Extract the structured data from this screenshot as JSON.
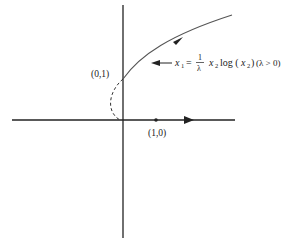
{
  "diagram": {
    "axes": {
      "origin": {
        "x": 123,
        "y": 120
      },
      "x_axis": {
        "x1": 12,
        "x2": 235,
        "y": 120
      },
      "y_axis": {
        "x": 123,
        "y1": 5,
        "y2": 238
      }
    },
    "points": {
      "p01": {
        "label": "(0,1)",
        "x": 123,
        "y": 79
      },
      "p10": {
        "label": "(1,0)",
        "x": 156,
        "y": 120
      }
    },
    "curve": {
      "equation_lhs": "x",
      "equation_lhs_sub": "1",
      "equation_eq": "=",
      "frac_num": "1",
      "frac_den": "λ",
      "equation_rhs_a": "x",
      "equation_rhs_a_sub": "2",
      "equation_rhs_log": "log (",
      "equation_rhs_b": "x",
      "equation_rhs_b_sub": "2",
      "equation_rhs_close": ")",
      "condition": "(λ > 0)"
    },
    "colors": {
      "line": "#222222",
      "curve": "#555555"
    }
  }
}
